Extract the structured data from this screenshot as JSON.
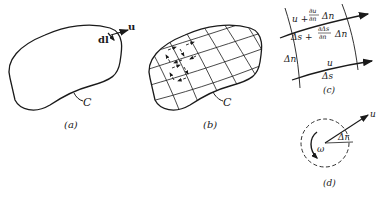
{
  "figure": {
    "panels": [
      {
        "id": "a",
        "caption": "(a)",
        "labels": {
          "velocity": "u",
          "element": "dl",
          "contour": "C"
        }
      },
      {
        "id": "b",
        "caption": "(b)",
        "labels": {
          "contour": "C"
        }
      },
      {
        "id": "c",
        "caption": "(c)",
        "labels": {
          "top_velocity": "u + ∂u/∂n Δn",
          "top_u": "u +",
          "top_frac_num": "∂u",
          "top_frac_den": "∂n",
          "top_dn": "Δn",
          "top_length_a": "Δs +",
          "top_length_num": "∂Δs",
          "top_length_den": "∂n",
          "top_length_dn": "Δn",
          "side": "Δn",
          "bottom_velocity": "u",
          "bottom_length": "Δs"
        }
      },
      {
        "id": "d",
        "caption": "(d)",
        "labels": {
          "velocity": "u",
          "radius": "Δr",
          "angular_velocity": "ω"
        }
      }
    ]
  },
  "colors": {
    "ink": "#1a1a1a",
    "background": "#ffffff"
  }
}
